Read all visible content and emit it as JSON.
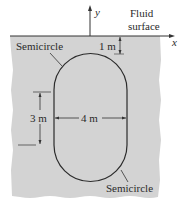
{
  "diagram": {
    "axis": {
      "x_label": "x",
      "y_label": "y"
    },
    "fluid_surface_label_line1": "Fluid",
    "fluid_surface_label_line2": "surface",
    "shape": {
      "top_label": "Semicircle",
      "bottom_label": "Semicircle"
    },
    "dimensions": {
      "depth_to_top": "1 m",
      "straight_height": "3 m",
      "width": "4 m"
    },
    "colors": {
      "fluid": "#d3d3d3",
      "outline": "#2b2b2b",
      "background": "#ffffff"
    }
  }
}
